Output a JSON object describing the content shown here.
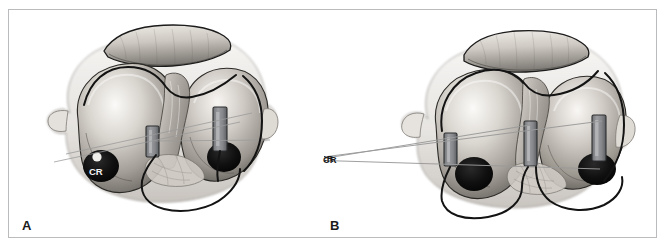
{
  "figure": {
    "background_color": "#ffffff",
    "frame_color": "#b9bbbd"
  },
  "panels": [
    {
      "id": "A",
      "letter": "A",
      "caption_label": "A",
      "annotations": [
        {
          "name": "cr-label",
          "text": "CR",
          "style": "light-on-dark",
          "target": "medial-condyle-lesion"
        }
      ],
      "implants": {
        "count": 2,
        "label": "electrode-pad",
        "color": "#8c8e90"
      },
      "lesions": {
        "count": 2,
        "color": "#111111"
      },
      "cables": {
        "count": 1,
        "color": "#131313"
      }
    },
    {
      "id": "B",
      "letter": "B",
      "caption_label": "B",
      "annotations": [
        {
          "name": "cr-label",
          "text": "CR",
          "style": "dark-on-white",
          "leader_lines": 2,
          "target": "posterior-implants"
        }
      ],
      "implants": {
        "count": 3,
        "label": "electrode-pad",
        "color": "#8c8e90"
      },
      "lesions": {
        "count": 2,
        "color": "#111111"
      },
      "cables": {
        "count": 2,
        "color": "#131313"
      }
    }
  ],
  "colors": {
    "ink": "#1a1a1a",
    "frame": "#b9bbbd",
    "tissue_light": "#f3f1ee",
    "tissue_mid": "#b9b6b1",
    "tissue_dark": "#6e6b67",
    "lesion": "#111111",
    "implant": "#8c8e90",
    "leader": "#9a9a9a",
    "outline": "#141414"
  }
}
